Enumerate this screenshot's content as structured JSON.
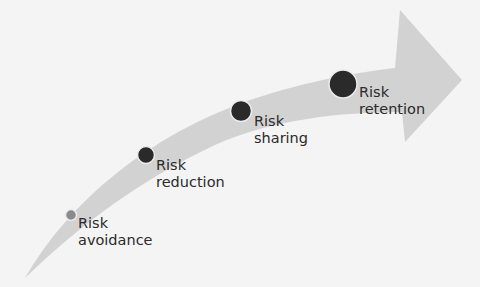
{
  "diagram": {
    "type": "curved-progress-arrow",
    "colors": {
      "background": "#f4f4f4",
      "arrow": "#d2d2d2",
      "marker": "#2a2a2a",
      "marker_light": "#8a8a8a",
      "marker_ring": "#ececec",
      "text": "#2b2b2b"
    },
    "stages": [
      {
        "line1": "Risk",
        "line2": "avoidance",
        "marker_size": "small"
      },
      {
        "line1": "Risk",
        "line2": "reduction",
        "marker_size": "medium"
      },
      {
        "line1": "Risk",
        "line2": "sharing",
        "marker_size": "large"
      },
      {
        "line1": "Risk",
        "line2": "retention",
        "marker_size": "x-large"
      }
    ]
  }
}
